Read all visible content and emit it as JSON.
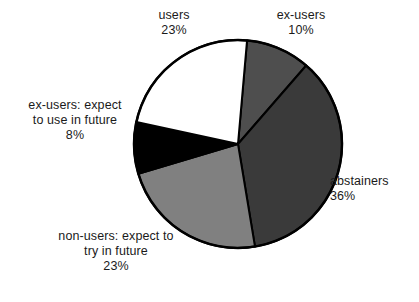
{
  "chart_data": {
    "type": "pie",
    "title": "",
    "subtitle": "",
    "xlabel": "",
    "ylabel": "",
    "grid": false,
    "legend_position": "none",
    "label_format": "name above percent",
    "start_angle_deg": 5,
    "direction": "clockwise",
    "categories": [
      "ex-users",
      "abstainers",
      "non-users: expect to try in future",
      "ex-users: expect to use in future",
      "users"
    ],
    "values": [
      10,
      36,
      23,
      8,
      23
    ],
    "units": "%",
    "total": 100,
    "slices": [
      {
        "name": "ex-users",
        "value": 10,
        "value_text": "10%",
        "color": "#4e4e4e",
        "stroke": "#000000",
        "label_lines": [
          "ex-users",
          "10%"
        ]
      },
      {
        "name": "abstainers",
        "value": 36,
        "value_text": "36%",
        "color": "#3a3a3a",
        "stroke": "#000000",
        "label_lines": [
          "abstainers",
          "36%"
        ]
      },
      {
        "name": "non-users: expect to try in future",
        "value": 23,
        "value_text": "23%",
        "color": "#808080",
        "stroke": "#000000",
        "label_lines": [
          "non-users: expect to",
          "try in future",
          "23%"
        ]
      },
      {
        "name": "ex-users: expect to use in future",
        "value": 8,
        "value_text": "8%",
        "color": "#000000",
        "stroke": "#000000",
        "label_lines": [
          "ex-users: expect",
          "to use in future",
          "8%"
        ]
      },
      {
        "name": "users",
        "value": 23,
        "value_text": "23%",
        "color": "#ffffff",
        "stroke": "#000000",
        "label_lines": [
          "users",
          "23%"
        ]
      }
    ]
  },
  "labels": {
    "users": {
      "line1": "users",
      "value": "23%"
    },
    "ex_users": {
      "line1": "ex-users",
      "value": "10%"
    },
    "abstainers": {
      "line1": "abstainers",
      "value": "36%"
    },
    "ex_users_future": {
      "line1": "ex-users: expect",
      "line2": "to use in future",
      "value": "8%"
    },
    "non_users_future": {
      "line1": "non-users: expect to",
      "line2": "try in future",
      "value": "23%"
    }
  },
  "colors": {
    "background": "#ffffff",
    "text": "#1a1a1a",
    "outline": "#000000",
    "slice_ex_users": "#4e4e4e",
    "slice_abstainers": "#3a3a3a",
    "slice_non_users": "#808080",
    "slice_ex_users_future": "#000000",
    "slice_users": "#ffffff"
  }
}
